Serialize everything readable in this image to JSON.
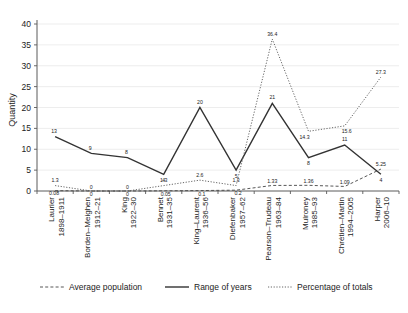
{
  "chart_data": {
    "type": "line",
    "title": "",
    "xlabel": "",
    "ylabel": "Quantity",
    "ylim": [
      0,
      40
    ],
    "yticks": [
      0,
      5,
      10,
      15,
      20,
      25,
      30,
      35,
      40
    ],
    "grid": true,
    "legend_position": "bottom",
    "categories": [
      "Laurier\n1898–1911",
      "Borden–Meighen\n1912–21",
      "King\n1922–30",
      "Bennet\n1931–35",
      "King–Laurent\n1936–56",
      "Diefenbaker\n1957–62",
      "Pearson–Trudeau\n1963–84",
      "Mulroney\n1985–93",
      "Chrétien–Martin\n1994–2005",
      "Harper\n2006–10"
    ],
    "category_names": [
      "Laurier",
      "Borden–Meighen",
      "King",
      "Bennet",
      "King–Laurent",
      "Diefenbaker",
      "Pearson–Trudeau",
      "Mulroney",
      "Chrétien–Martin",
      "Harper"
    ],
    "category_years": [
      "1898–1911",
      "1912–21",
      "1922–30",
      "1931–35",
      "1936–56",
      "1957–62",
      "1963–84",
      "1985–93",
      "1994–2005",
      "2006–10"
    ],
    "series": [
      {
        "name": "Average population",
        "style": "dashed",
        "values": [
          0.08,
          0,
          0,
          0.05,
          0.1,
          0.2,
          1.33,
          1.36,
          1.09,
          5.25
        ],
        "labels": [
          "0.08",
          "0",
          "0",
          "0.05",
          "0.1",
          "0.2",
          "1.33",
          "1.36",
          "1.09",
          "5.25"
        ]
      },
      {
        "name": "Range of years",
        "style": "solid",
        "values": [
          13,
          9,
          8,
          4,
          20,
          5,
          21,
          8,
          11,
          4
        ],
        "labels": [
          "13",
          "9",
          "8",
          "4",
          "20",
          "5",
          "21",
          "8",
          "11",
          "4"
        ]
      },
      {
        "name": "Percentage of totals",
        "style": "dotted",
        "values": [
          1.3,
          0,
          0,
          1.3,
          2.6,
          1.3,
          36.4,
          14.3,
          15.6,
          27.3
        ],
        "labels": [
          "1.3",
          "0",
          "0",
          "1.3",
          "2.6",
          "1.3",
          "36.4",
          "14.3",
          "15.6",
          "27.3"
        ]
      }
    ]
  },
  "legend": {
    "items": [
      {
        "label": "Average population",
        "style": "dashed"
      },
      {
        "label": "Range of years",
        "style": "solid"
      },
      {
        "label": "Percentage of totals",
        "style": "dotted"
      }
    ]
  },
  "colors": {
    "solid": "#333333",
    "dashed": "#444444",
    "dotted": "#555555",
    "grid": "#e9e9e9",
    "axis": "#5a5a5a",
    "text": "#1c1c1c",
    "background": "#ffffff"
  }
}
